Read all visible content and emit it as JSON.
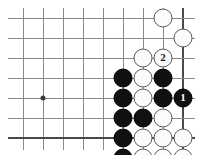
{
  "diagram": {
    "kind": "go-board-problem-diagram",
    "board": {
      "columns": 9,
      "rows": 7,
      "origin_x": 23,
      "origin_y": 18,
      "spacing": 20,
      "line_color": "#8a8a8a",
      "edge_color": "#4a4a4a",
      "background": "#ffffff",
      "right_edge_is_board_edge": true,
      "bottom_edge_is_board_edge": true,
      "star_points": [
        {
          "col": 1,
          "row": 4
        }
      ]
    },
    "stones": [
      {
        "col": 7,
        "row": 0,
        "color": "white",
        "label": ""
      },
      {
        "col": 8,
        "row": 1,
        "color": "white",
        "label": ""
      },
      {
        "col": 6,
        "row": 2,
        "color": "white",
        "label": ""
      },
      {
        "col": 7,
        "row": 2,
        "color": "white",
        "label": "2"
      },
      {
        "col": 5,
        "row": 3,
        "color": "black",
        "label": ""
      },
      {
        "col": 6,
        "row": 3,
        "color": "white",
        "label": ""
      },
      {
        "col": 7,
        "row": 3,
        "color": "black",
        "label": ""
      },
      {
        "col": 5,
        "row": 4,
        "color": "black",
        "label": ""
      },
      {
        "col": 6,
        "row": 4,
        "color": "white",
        "label": ""
      },
      {
        "col": 7,
        "row": 4,
        "color": "black",
        "label": ""
      },
      {
        "col": 8,
        "row": 4,
        "color": "black",
        "label": "1"
      },
      {
        "col": 5,
        "row": 5,
        "color": "black",
        "label": ""
      },
      {
        "col": 6,
        "row": 5,
        "color": "black",
        "label": ""
      },
      {
        "col": 7,
        "row": 5,
        "color": "white",
        "label": ""
      },
      {
        "col": 5,
        "row": 6,
        "color": "black",
        "label": ""
      },
      {
        "col": 6,
        "row": 6,
        "color": "white",
        "label": ""
      },
      {
        "col": 7,
        "row": 6,
        "color": "white",
        "label": ""
      },
      {
        "col": 8,
        "row": 6,
        "color": "white",
        "label": ""
      },
      {
        "col": 5,
        "row": 7,
        "color": "black",
        "label": ""
      },
      {
        "col": 6,
        "row": 7,
        "color": "white",
        "label": ""
      },
      {
        "col": 7,
        "row": 7,
        "color": "white",
        "label": ""
      },
      {
        "col": 8,
        "row": 7,
        "color": "white",
        "label": ""
      },
      {
        "col": 5,
        "row": 8,
        "color": "black",
        "label": ""
      },
      {
        "col": 6,
        "row": 8,
        "color": "black",
        "label": ""
      },
      {
        "col": 7,
        "row": 8,
        "color": "black",
        "label": ""
      },
      {
        "col": 8,
        "row": 8,
        "color": "black",
        "label": ""
      }
    ],
    "move_labels": [
      {
        "label": "1",
        "color": "black",
        "col": 8,
        "row": 4
      },
      {
        "label": "2",
        "color": "white",
        "col": 7,
        "row": 2
      }
    ]
  }
}
